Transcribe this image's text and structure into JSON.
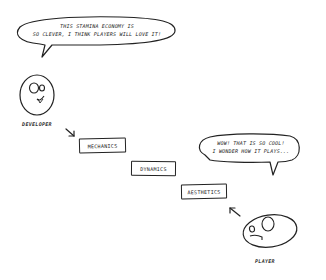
{
  "diagram": {
    "developer": {
      "label": "DEVELOPER",
      "speech": [
        "THIS STAMINA ECONOMY IS",
        "SO CLEVER, I THINK PLAYERS WILL LOVE IT!"
      ]
    },
    "player": {
      "label": "PLAYER",
      "speech": [
        "WOW! THAT IS SO COOL!",
        "I WONDER HOW IT PLAYS..."
      ]
    },
    "stages": [
      {
        "label": "MECHANICS"
      },
      {
        "label": "DYNAMICS"
      },
      {
        "label": "AESTHETICS"
      }
    ],
    "arrows": [
      {
        "from": "developer",
        "to": "MECHANICS"
      },
      {
        "from": "player",
        "to": "AESTHETICS"
      }
    ],
    "colors": {
      "ink": "#222222",
      "background": "#ffffff"
    }
  }
}
